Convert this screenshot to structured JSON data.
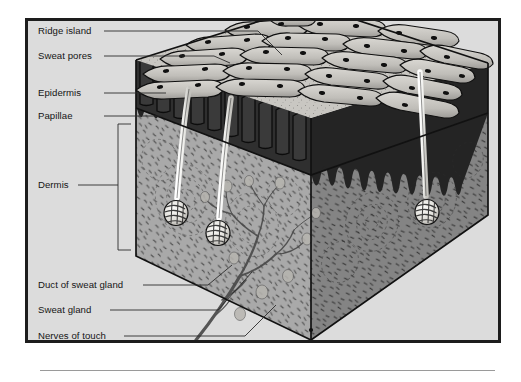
{
  "figure": {
    "frame": {
      "border_color": "#1d1d1d",
      "background_color": "#dcdcdc"
    },
    "palette": {
      "page_background": "#ffffff",
      "panel_background": "#dcdcdc",
      "epidermis_dark": "#2a2a2a",
      "ridge_surface": "#c9c7c2",
      "dermis_fill": "#a9a9a9",
      "dermis_shadow": "#8f8f8f",
      "duct_white": "#f2f2f0",
      "outline": "#141414",
      "label_text": "#151515",
      "leader_line": "#2b2b2b",
      "rule_line": "#9a9a9a"
    }
  },
  "labels": [
    {
      "id": "ridge-island",
      "text": "Ridge island",
      "x": 38,
      "y": 34
    },
    {
      "id": "sweat-pores",
      "text": "Sweat pores",
      "x": 38,
      "y": 59
    },
    {
      "id": "epidermis",
      "text": "Epidermis",
      "x": 38,
      "y": 96
    },
    {
      "id": "papillae",
      "text": "Papillae",
      "x": 38,
      "y": 119
    },
    {
      "id": "dermis",
      "text": "Dermis",
      "x": 38,
      "y": 188
    },
    {
      "id": "duct-of-sweat-gland",
      "text": "Duct of sweat gland",
      "x": 38,
      "y": 288
    },
    {
      "id": "sweat-gland",
      "text": "Sweat gland",
      "x": 38,
      "y": 313
    },
    {
      "id": "nerves-of-touch",
      "text": "Nerves of touch",
      "x": 38,
      "y": 339
    }
  ],
  "anatomy": {
    "layers": [
      {
        "name": "Ridge island",
        "description": "Short isolated friction ridge segment on the skin surface"
      },
      {
        "name": "Sweat pores",
        "description": "Dark oval openings spaced along the crest of each friction ridge"
      },
      {
        "name": "Epidermis",
        "description": "Dark outer layer forming the ridged surface band"
      },
      {
        "name": "Papillae",
        "description": "Downward finger-like projections at the epidermis-dermis boundary"
      },
      {
        "name": "Dermis",
        "description": "Thick stippled inner layer containing glands and nerves"
      },
      {
        "name": "Duct of sweat gland",
        "description": "Pale tube spiralling up through the epidermis to a surface pore"
      },
      {
        "name": "Sweat gland",
        "description": "Coiled ball of tubing deep in the dermis"
      },
      {
        "name": "Nerves of touch",
        "description": "Branching nerve tree rising through the lower dermis"
      }
    ],
    "counts": {
      "sweat_glands_visible": 3,
      "ducts_visible": 3
    }
  }
}
